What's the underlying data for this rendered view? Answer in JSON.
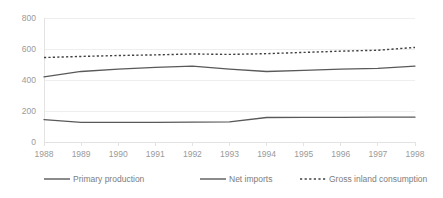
{
  "chart_data": {
    "type": "line",
    "title": "",
    "subtitle": "",
    "xlabel": "",
    "ylabel": "",
    "grid": true,
    "legend_position": "bottom",
    "x": [
      "1988",
      "1989",
      "1990",
      "1991",
      "1992",
      "1993",
      "1994",
      "1995",
      "1996",
      "1997",
      "1998"
    ],
    "categories": [
      "1988",
      "1989",
      "1990",
      "1991",
      "1992",
      "1993",
      "1994",
      "1995",
      "1996",
      "1997",
      "1998"
    ],
    "ylim": [
      0,
      800
    ],
    "yticks": [
      "0",
      "200",
      "400",
      "600",
      "800"
    ],
    "ytick_values": [
      0,
      200,
      400,
      600,
      800
    ],
    "series": [
      {
        "name": "Primary production",
        "style": "solid",
        "color": "#595959",
        "values": [
          420,
          455,
          470,
          482,
          490,
          470,
          455,
          462,
          470,
          475,
          490
        ]
      },
      {
        "name": "Net imports",
        "style": "solid",
        "color": "#595959",
        "values": [
          145,
          126,
          126,
          127,
          128,
          130,
          158,
          159,
          159,
          160,
          160
        ]
      },
      {
        "name": "Gross inland consumption",
        "style": "dotted",
        "color": "#404040",
        "values": [
          545,
          552,
          558,
          562,
          568,
          565,
          570,
          578,
          586,
          592,
          610
        ]
      }
    ]
  },
  "legend": {
    "items": [
      {
        "label": "Primary production",
        "style": "solid",
        "color": "#595959"
      },
      {
        "label": "Net imports",
        "style": "solid",
        "color": "#595959"
      },
      {
        "label": "Gross inland consumption",
        "style": "dotted",
        "color": "#404040"
      }
    ]
  },
  "colors": {
    "background": "#ffffff",
    "gridline": "#eeeeee",
    "axis": "#e3e3e3",
    "tick_text": "#9a9a9a",
    "legend_text": "#7d7d7d",
    "series_solid": "#595959",
    "series_dotted": "#404040"
  }
}
